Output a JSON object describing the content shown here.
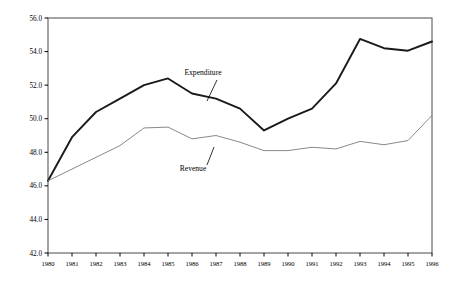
{
  "chart_data": {
    "type": "line",
    "title": "",
    "xlabel": "",
    "ylabel": "",
    "grid": false,
    "legend_position": "inline-annotations",
    "x": [
      1980,
      1981,
      1982,
      1983,
      1984,
      1985,
      1986,
      1987,
      1988,
      1989,
      1990,
      1991,
      1992,
      1993,
      1994,
      1995,
      1996
    ],
    "categories": [
      "1980",
      "1981",
      "1982",
      "1983",
      "1984",
      "1985",
      "1986",
      "1987",
      "1988",
      "1989",
      "1990",
      "1991",
      "1992",
      "1993",
      "1994",
      "1995",
      "1996"
    ],
    "xlim": [
      1980,
      1996
    ],
    "ylim": [
      42.0,
      56.0
    ],
    "ytick_labels": [
      "56.0",
      "54.0",
      "52.0",
      "50.0",
      "48.0",
      "46.0",
      "44.0",
      "42.0"
    ],
    "ytick_values": [
      56.0,
      54.0,
      52.0,
      50.0,
      48.0,
      46.0,
      44.0,
      42.0
    ],
    "series": [
      {
        "name": "Expenditure",
        "color": "#1a1a1a",
        "line_width": 1.9,
        "values": [
          46.3,
          48.9,
          50.4,
          51.2,
          52.0,
          52.4,
          51.5,
          51.2,
          50.6,
          49.3,
          50.0,
          50.6,
          52.1,
          54.75,
          54.2,
          54.05,
          54.6
        ],
        "annotation": {
          "label": "Expenditure",
          "label_x": 203,
          "label_y": 75,
          "leader_from_x": 217,
          "leader_from_y": 80,
          "leader_to_x": 207,
          "leader_to_y": 101
        }
      },
      {
        "name": "Revenue",
        "color": "#7a7a7a",
        "line_width": 0.9,
        "values": [
          46.3,
          47.0,
          47.7,
          48.4,
          49.45,
          49.5,
          48.8,
          49.0,
          48.6,
          48.1,
          48.1,
          48.3,
          48.2,
          48.65,
          48.45,
          48.7,
          50.2
        ],
        "annotation": {
          "label": "Revenue",
          "label_x": 193,
          "label_y": 171,
          "leader_from_x": 207,
          "leader_from_y": 165,
          "leader_to_x": 214,
          "leader_to_y": 147
        }
      }
    ],
    "plot_area": {
      "left": 48,
      "right": 432,
      "top": 18,
      "bottom": 253,
      "border_color": "#4a4a4a"
    }
  }
}
